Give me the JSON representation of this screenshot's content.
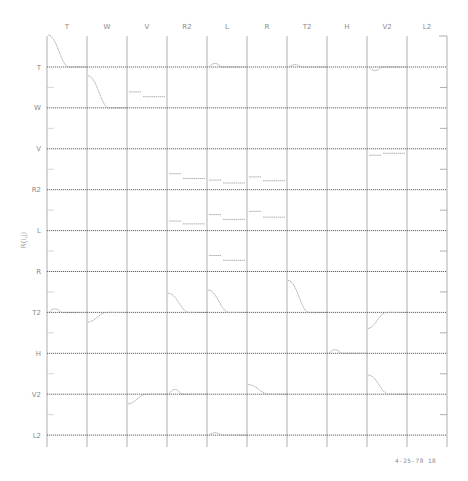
{
  "chart_data": {
    "type": "line",
    "title": "",
    "subtitle": "",
    "variables": [
      "T",
      "W",
      "V",
      "R2",
      "L",
      "R",
      "T2",
      "H",
      "V2",
      "L2"
    ],
    "column_labels": [
      "T",
      "W",
      "V",
      "R2",
      "L",
      "R",
      "T2",
      "H",
      "V2",
      "L2"
    ],
    "row_labels": [
      "T",
      "W",
      "V",
      "R2",
      "L",
      "R",
      "T2",
      "H",
      "V2",
      "L2"
    ],
    "ylabel": "R(i,j)",
    "xlabel": "",
    "grid": true,
    "legend": null,
    "footer_stamp": "4-25-78 18",
    "colors": {
      "grid": "#7a7a7a",
      "baseline": "#555555",
      "curve": "#9a9a9a",
      "text": "#8a8a8a"
    },
    "cells_with_visible_features": [
      {
        "row": "T",
        "col": "T",
        "shape": "decay from +1 to 0",
        "peak": 1.0
      },
      {
        "row": "T",
        "col": "L",
        "shape": "small bump",
        "peak": 0.15
      },
      {
        "row": "T",
        "col": "T2",
        "shape": "small bump",
        "peak": 0.1
      },
      {
        "row": "T",
        "col": "V2",
        "shape": "small dip",
        "peak": -0.15
      },
      {
        "row": "W",
        "col": "W",
        "shape": "decay from +1 to 0",
        "peak": 1.0
      },
      {
        "row": "W",
        "col": "V",
        "shape": "step offset",
        "peak": 0.5
      },
      {
        "row": "V",
        "col": "V2",
        "shape": "step negative",
        "peak": -0.2
      },
      {
        "row": "R2",
        "col": "R2",
        "shape": "step offset",
        "peak": 0.5
      },
      {
        "row": "R2",
        "col": "L",
        "shape": "step offset",
        "peak": 0.3
      },
      {
        "row": "R2",
        "col": "R",
        "shape": "step offset",
        "peak": 0.4
      },
      {
        "row": "L",
        "col": "R2",
        "shape": "step offset",
        "peak": 0.3
      },
      {
        "row": "L",
        "col": "L",
        "shape": "step offset",
        "peak": 0.5
      },
      {
        "row": "L",
        "col": "R",
        "shape": "step offset",
        "peak": 0.6
      },
      {
        "row": "R",
        "col": "L",
        "shape": "step offset",
        "peak": 0.5
      },
      {
        "row": "T2",
        "col": "T",
        "shape": "small bump",
        "peak": 0.15
      },
      {
        "row": "T2",
        "col": "W",
        "shape": "dip recovering",
        "peak": -0.3
      },
      {
        "row": "T2",
        "col": "R2",
        "shape": "decay",
        "peak": 0.6
      },
      {
        "row": "T2",
        "col": "L",
        "shape": "decay",
        "peak": 0.7
      },
      {
        "row": "T2",
        "col": "T2",
        "shape": "decay from +1 to 0",
        "peak": 1.0
      },
      {
        "row": "T2",
        "col": "V2",
        "shape": "dip recovering",
        "peak": -0.5
      },
      {
        "row": "H",
        "col": "H",
        "shape": "small bump",
        "peak": 0.15
      },
      {
        "row": "V2",
        "col": "V",
        "shape": "dip",
        "peak": -0.3
      },
      {
        "row": "V2",
        "col": "R2",
        "shape": "small bump",
        "peak": 0.2
      },
      {
        "row": "V2",
        "col": "R",
        "shape": "decay",
        "peak": 0.3
      },
      {
        "row": "V2",
        "col": "V2",
        "shape": "decay",
        "peak": 0.6
      },
      {
        "row": "L2",
        "col": "L",
        "shape": "small bump",
        "peak": 0.1
      }
    ]
  },
  "stamp": {
    "text": "4-25-78 18"
  },
  "axis": {
    "y_title": "R(i,j)"
  }
}
